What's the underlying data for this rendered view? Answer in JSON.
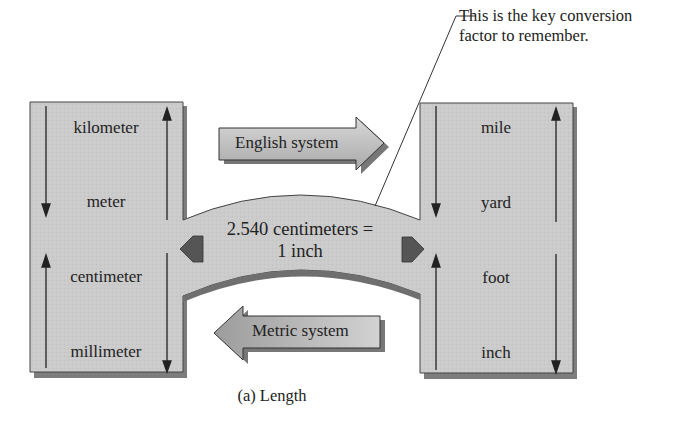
{
  "figure": {
    "caption": "(a) Length",
    "callout": {
      "line1": "This is the key conversion",
      "line2": "factor to remember."
    },
    "conversion": {
      "line1": "2.540 centimeters =",
      "line2": "1 inch"
    },
    "arrows": {
      "to_english": "English system",
      "to_metric": "Metric system"
    },
    "metric_units": [
      "kilometer",
      "meter",
      "centimeter",
      "millimeter"
    ],
    "english_units": [
      "mile",
      "yard",
      "foot",
      "inch"
    ],
    "colors": {
      "panel_fill": "#c9c9c9",
      "panel_shadow": "#7a7a7a",
      "arrow_fill": "#b9b9b9",
      "arrow_head_dark": "#555555",
      "outline": "#333333"
    }
  }
}
